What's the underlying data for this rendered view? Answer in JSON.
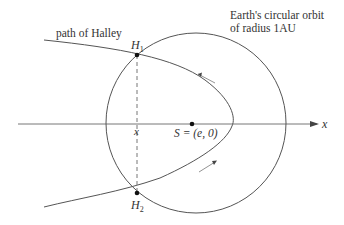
{
  "diagram": {
    "labels": {
      "halley_path": "path of Halley",
      "orbit_line1": "Earth's circular orbit",
      "orbit_line2": "of radius 1AU",
      "h1": "H",
      "h1_sub": "1",
      "h2": "H",
      "h2_sub": "2",
      "x_foot": "x",
      "sun": "S = (e, 0)",
      "x_axis": "x"
    },
    "colors": {
      "stroke": "#555555",
      "text": "#333333",
      "point": "#111111"
    }
  }
}
